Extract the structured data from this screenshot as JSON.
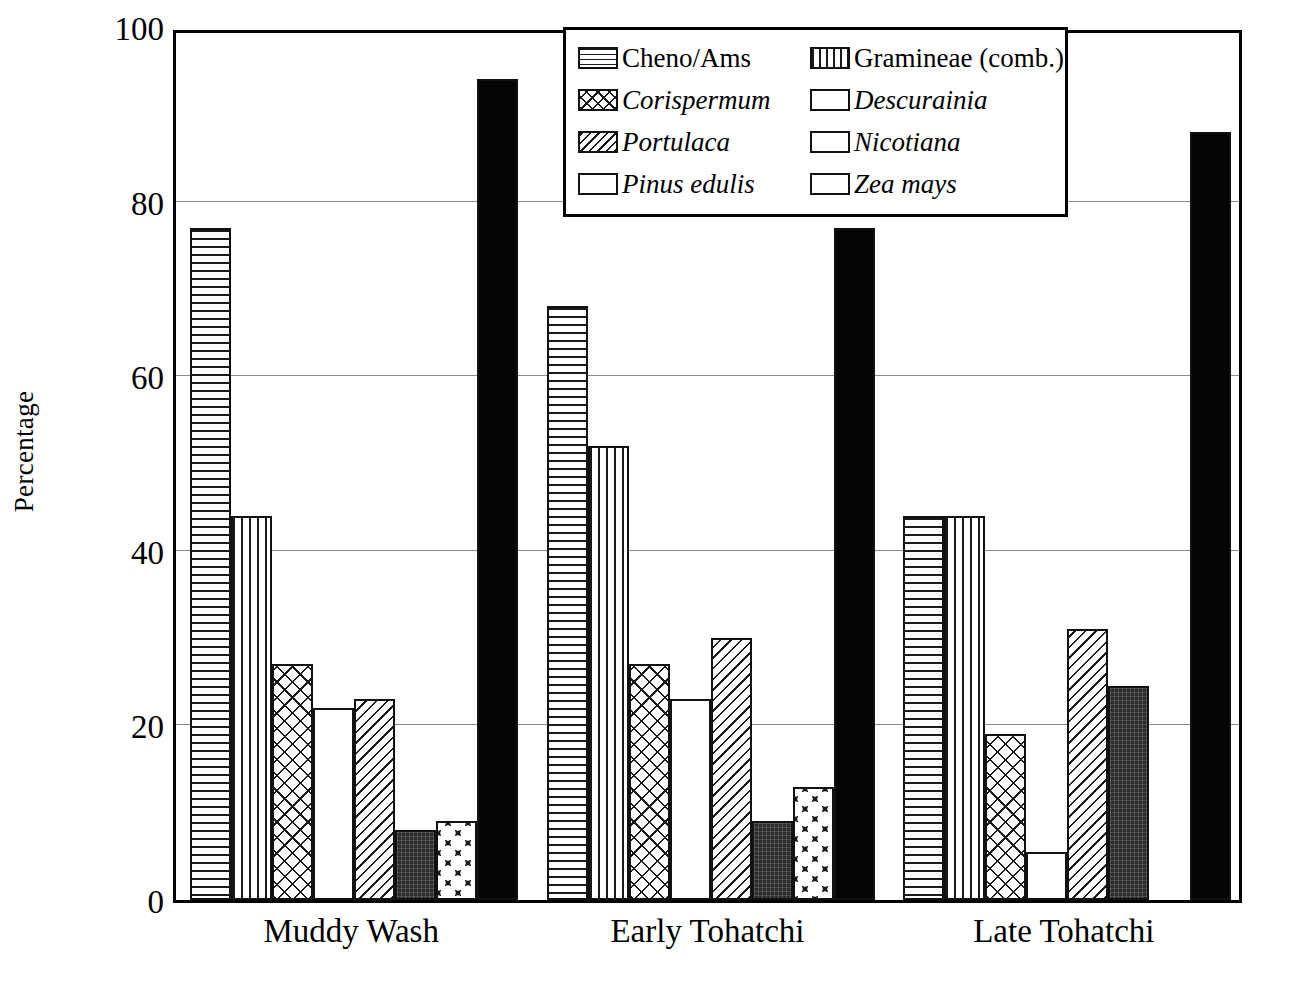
{
  "chart_data": {
    "type": "bar",
    "title": "",
    "xlabel": "",
    "ylabel": "Percentage",
    "ylim": [
      0,
      100
    ],
    "yticks": [
      0,
      20,
      40,
      60,
      80,
      100
    ],
    "ytick_labels": [
      "0",
      "20",
      "40",
      "60",
      "80",
      "100"
    ],
    "grid": "horizontal",
    "legend_position": "top-center",
    "categories": [
      "Muddy Wash",
      "Early Tohatchi",
      "Late Tohatchi"
    ],
    "series": [
      {
        "name": "Cheno/Ams",
        "italic": false,
        "pattern": "horizontal-lines",
        "values": [
          77,
          68,
          44
        ]
      },
      {
        "name": "Gramineae (comb.)",
        "italic": false,
        "pattern": "vertical-lines",
        "values": [
          44,
          52,
          44
        ]
      },
      {
        "name": "Corispermum",
        "italic": true,
        "pattern": "cross-hatch",
        "values": [
          27,
          27,
          19
        ]
      },
      {
        "name": "Descurainia",
        "italic": true,
        "pattern": "empty",
        "values": [
          22,
          23,
          5.5
        ]
      },
      {
        "name": "Portulaca",
        "italic": true,
        "pattern": "diagonal-lines",
        "values": [
          23,
          30,
          31
        ]
      },
      {
        "name": "Nicotiana",
        "italic": true,
        "pattern": "dark-fill",
        "values": [
          8,
          9,
          24.5
        ]
      },
      {
        "name": "Pinus edulis",
        "italic": true,
        "pattern": "circles",
        "values": [
          9,
          13,
          0
        ]
      },
      {
        "name": "Zea mays",
        "italic": true,
        "pattern": "solid-black",
        "values": [
          94,
          77,
          88
        ]
      }
    ]
  },
  "legend": {
    "rows": [
      {
        "left": {
          "label": "Cheno/Ams",
          "italic": false,
          "pattern": "p-horiz"
        },
        "right": {
          "label": "Gramineae (comb.)",
          "italic": false,
          "pattern": "p-vert"
        }
      },
      {
        "left": {
          "label": "Corispermum",
          "italic": true,
          "pattern": "p-cross"
        },
        "right": {
          "label": "Descurainia",
          "italic": true,
          "pattern": "p-none"
        }
      },
      {
        "left": {
          "label": "Portulaca",
          "italic": true,
          "pattern": "p-diag"
        },
        "right": {
          "label": "Nicotiana",
          "italic": true,
          "pattern": "p-dark"
        }
      },
      {
        "left": {
          "label": "Pinus edulis",
          "italic": true,
          "pattern": "p-circles"
        },
        "right": {
          "label": "Zea mays",
          "italic": true,
          "pattern": "p-solid"
        }
      }
    ]
  },
  "colors": {
    "axis": "#000000",
    "gridline": "#8a8a8a",
    "bar_outline": "#111111",
    "solid_fill": "#050505",
    "dark_fill": "#2b2b2b",
    "background": "#ffffff"
  },
  "caption": ""
}
